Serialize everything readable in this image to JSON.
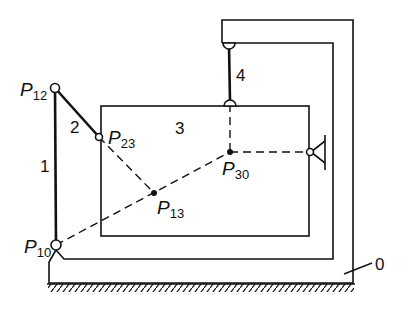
{
  "diagram": {
    "type": "mechanism-kinematic-diagram",
    "colors": {
      "line": "#111111",
      "background": "#ffffff"
    },
    "links": [
      {
        "id": "0",
        "label": "0"
      },
      {
        "id": "1",
        "label": "1"
      },
      {
        "id": "2",
        "label": "2"
      },
      {
        "id": "3",
        "label": "3"
      },
      {
        "id": "4",
        "label": "4"
      }
    ],
    "poles": [
      {
        "id": "P12",
        "letter": "P",
        "sub": "12",
        "kind": "joint-open"
      },
      {
        "id": "P23",
        "letter": "P",
        "sub": "23",
        "kind": "joint-open"
      },
      {
        "id": "P13",
        "letter": "P",
        "sub": "13",
        "kind": "point-filled"
      },
      {
        "id": "P30",
        "letter": "P",
        "sub": "30",
        "kind": "point-filled"
      },
      {
        "id": "P10",
        "letter": "P",
        "sub": "10",
        "kind": "joint-open"
      }
    ]
  }
}
